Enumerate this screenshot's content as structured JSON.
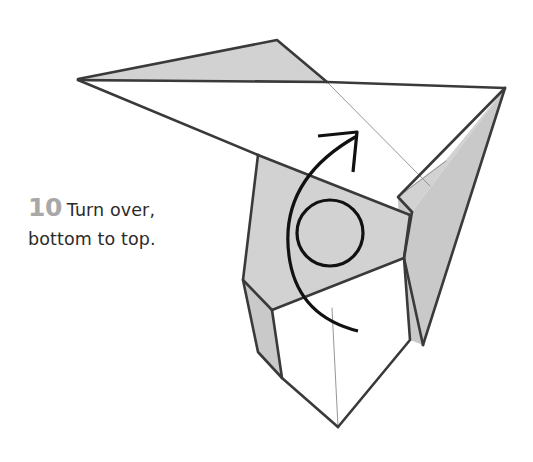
{
  "page": {
    "width": 533,
    "height": 462,
    "background_color": "#ffffff",
    "kind": "origami-instruction-diagram"
  },
  "caption": {
    "step_number": "10",
    "line_1": "Turn over,",
    "line_2": "bottom to top.",
    "full_text": "10 Turn over, bottom to top.",
    "number_color": "#a8a8a8",
    "text_color": "#2b2b2b"
  },
  "styles": {
    "paper_white": "#ffffff",
    "paper_gray": "#d2d2d2",
    "paper_gray_dark": "#c9c9c9",
    "outline_color": "#3a3a3a",
    "crease_color": "#8a8a8a",
    "arrow_color": "#111111",
    "outline_width": 2.6,
    "crease_width": 0.9,
    "arrow_width": 3.2
  },
  "figure": {
    "name": "paper-crane-model",
    "shapes": [
      {
        "name": "left-wing-gray-top",
        "fill": "gray",
        "points": "78,79 277,40 327,82 90,82"
      },
      {
        "name": "right-wing-white-top",
        "fill": "white",
        "points": "327,82 505,88 430,185 327,83"
      },
      {
        "name": "left-wing-white-under",
        "fill": "white",
        "points": "78,80 258,155 262,218 243,249"
      },
      {
        "name": "right-tail-gray-upper",
        "fill": "gray",
        "points": "505,88 412,212 398,196 446,160"
      },
      {
        "name": "right-tail-gray-lower",
        "fill": "gray",
        "points": "505,88 423,345 400,300 398,198 412,212"
      },
      {
        "name": "body-center-gray",
        "fill": "gray",
        "points": "258,155 410,215 404,258 272,310 243,280"
      },
      {
        "name": "body-left-flap-gray",
        "fill": "gray",
        "points": "243,280 272,310 282,378 258,352"
      },
      {
        "name": "body-lower-white",
        "fill": "white",
        "points": "272,310 404,258 410,340 338,427 282,378"
      },
      {
        "name": "body-right-flap-gray",
        "fill": "gray",
        "points": "404,258 423,345 410,340"
      }
    ],
    "creases": [
      {
        "name": "crease-wing-diagonal",
        "path": "M 328,83 L 430,186"
      },
      {
        "name": "crease-tail-short",
        "path": "M 446,161 L 398,197"
      },
      {
        "name": "crease-body-center-vertical",
        "path": "M 332,308 L 338,427"
      }
    ],
    "outlines": [
      {
        "name": "outline-left-wing-top",
        "path": "M 78,79 L 277,40 L 327,82"
      },
      {
        "name": "outline-wing-spine",
        "path": "M 78,80 L 327,82 L 505,88"
      },
      {
        "name": "outline-left-wing-lower",
        "path": "M 78,80 L 258,155"
      },
      {
        "name": "outline-tail-right",
        "path": "M 505,88 L 423,345"
      },
      {
        "name": "outline-tail-left",
        "path": "M 505,88 L 398,197 L 412,212"
      },
      {
        "name": "outline-tail-inner",
        "path": "M 412,212 L 404,258 L 423,345"
      },
      {
        "name": "outline-body-top",
        "path": "M 258,155 L 410,215"
      },
      {
        "name": "outline-body-right",
        "path": "M 410,215 L 404,258 L 272,310"
      },
      {
        "name": "outline-body-left",
        "path": "M 258,155 L 243,280 L 272,310"
      },
      {
        "name": "outline-flap-left",
        "path": "M 243,280 L 258,352 L 282,378"
      },
      {
        "name": "outline-body-lower-left",
        "path": "M 272,310 L 282,378 L 338,427"
      },
      {
        "name": "outline-body-lower-right",
        "path": "M 404,258 L 410,340 L 338,427"
      }
    ]
  },
  "arrow": {
    "name": "turn-over-arrow",
    "semantic": "rotate-flip-arrow",
    "loop_circle": {
      "cx": 330,
      "cy": 233,
      "r": 33
    },
    "curve_path": "M 357,136 C 300,168 281,212 290,262 C 297,300 322,322 358,331",
    "head_path": "M 318,136 L 357,132 L 353,172",
    "color": "#111111"
  }
}
